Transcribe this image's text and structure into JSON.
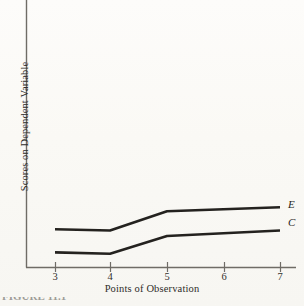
{
  "figure": {
    "caption_fragment": "FIGURE 11.1"
  },
  "chart_data": {
    "type": "line",
    "title": "",
    "subtitle": "",
    "xlabel": "Points of Observation",
    "ylabel": "Scores on Dependent Variable",
    "x": [
      3,
      4,
      5,
      7
    ],
    "xticklabels": [
      "3",
      "4",
      "5",
      "6",
      "7"
    ],
    "xticks": [
      3,
      4,
      5,
      6,
      7
    ],
    "xlim": [
      2.6,
      7.4
    ],
    "ylim": [
      0,
      100
    ],
    "yticklabels": [],
    "grid": false,
    "legend_position": "right-of-line-ends",
    "series": [
      {
        "name": "E",
        "label": "E",
        "color": "#24221f",
        "values": [
          28,
          27,
          41,
          44
        ]
      },
      {
        "name": "C",
        "label": "C",
        "color": "#24221f",
        "values": [
          11,
          10,
          23,
          27
        ]
      }
    ],
    "annotations": [
      {
        "text": "E",
        "at_x": 7,
        "position": "line-end-upper"
      },
      {
        "text": "C",
        "at_x": 7,
        "position": "line-end-lower"
      }
    ]
  },
  "axes": {
    "x_title": "Points of Observation",
    "y_title": "Scores on Dependent Variable",
    "tick_labels": {
      "t3": "3",
      "t4": "4",
      "t5": "5",
      "t6": "6",
      "t7": "7"
    }
  },
  "series_labels": {
    "experimental": "E",
    "control": "C"
  },
  "colors": {
    "ink": "#24221f",
    "axis": "#6f6c66",
    "paper": "#fbfaf7"
  }
}
